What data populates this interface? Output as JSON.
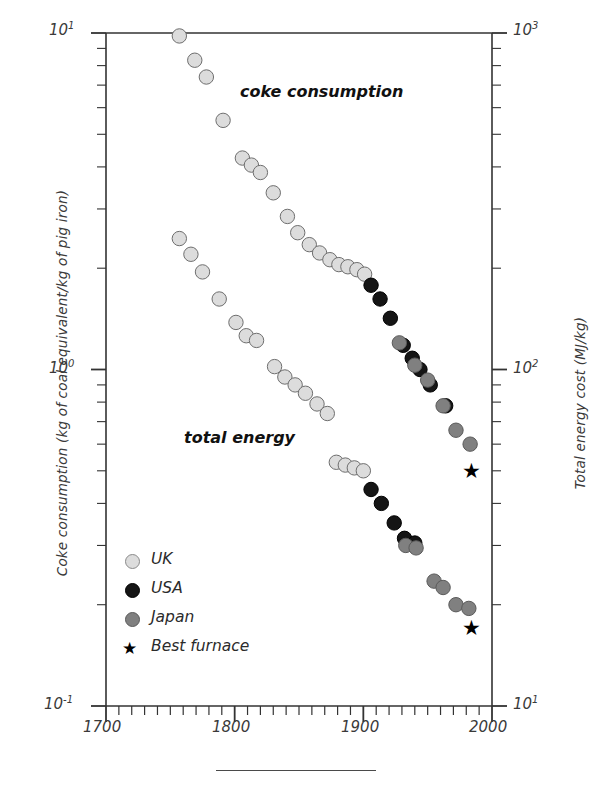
{
  "chart_data": {
    "type": "scatter",
    "title": "",
    "xlabel": "",
    "ylabel": "Coke consumption  (kg of coal equivalent/kg of pig iron)",
    "ylabel_right": "Total energy cost  (MJ/kg)",
    "xlim": [
      1700,
      2000
    ],
    "ylim": [
      0.1,
      10
    ],
    "ylim_right": [
      10,
      1000
    ],
    "yscale": "log",
    "xticks": [
      1700,
      1800,
      1900,
      2000
    ],
    "xticklabels": [
      "1700",
      "1800",
      "1900",
      "2000"
    ],
    "xminor_step": 10,
    "yticks": [
      0.1,
      1,
      10
    ],
    "yticklabels": [
      "10-1",
      "100",
      "101"
    ],
    "yticklabels_right": [
      "101",
      "102",
      "103"
    ],
    "grid": false,
    "legend_position": "lower-left",
    "annotations": [
      {
        "text": "coke consumption",
        "x": 1845,
        "y": 5.1
      },
      {
        "text": "total energy",
        "x": 1812,
        "y": 0.56
      }
    ],
    "series": [
      {
        "name": "UK",
        "color": "#dcdcdc",
        "edge": "#6e6e6e",
        "marker": "circle",
        "points": [
          {
            "x": 1757,
            "y": 9.8
          },
          {
            "x": 1769,
            "y": 8.3
          },
          {
            "x": 1778,
            "y": 7.4
          },
          {
            "x": 1791,
            "y": 5.5
          },
          {
            "x": 1806,
            "y": 4.25
          },
          {
            "x": 1813,
            "y": 4.05
          },
          {
            "x": 1820,
            "y": 3.85
          },
          {
            "x": 1830,
            "y": 3.35
          },
          {
            "x": 1841,
            "y": 2.85
          },
          {
            "x": 1849,
            "y": 2.55
          },
          {
            "x": 1858,
            "y": 2.35
          },
          {
            "x": 1866,
            "y": 2.22
          },
          {
            "x": 1874,
            "y": 2.12
          },
          {
            "x": 1881,
            "y": 2.05
          },
          {
            "x": 1888,
            "y": 2.02
          },
          {
            "x": 1895,
            "y": 1.98
          },
          {
            "x": 1901,
            "y": 1.92
          },
          {
            "x": 1757,
            "y": 2.45
          },
          {
            "x": 1766,
            "y": 2.2
          },
          {
            "x": 1775,
            "y": 1.95
          },
          {
            "x": 1788,
            "y": 1.62
          },
          {
            "x": 1801,
            "y": 1.38
          },
          {
            "x": 1809,
            "y": 1.26
          },
          {
            "x": 1817,
            "y": 1.22
          },
          {
            "x": 1831,
            "y": 1.02
          },
          {
            "x": 1839,
            "y": 0.95
          },
          {
            "x": 1847,
            "y": 0.9
          },
          {
            "x": 1855,
            "y": 0.85
          },
          {
            "x": 1864,
            "y": 0.79
          },
          {
            "x": 1872,
            "y": 0.74
          },
          {
            "x": 1879,
            "y": 0.53
          },
          {
            "x": 1886,
            "y": 0.52
          },
          {
            "x": 1893,
            "y": 0.51
          },
          {
            "x": 1900,
            "y": 0.5
          }
        ]
      },
      {
        "name": "USA",
        "color": "#151515",
        "edge": "#000000",
        "marker": "circle",
        "points": [
          {
            "x": 1906,
            "y": 1.78
          },
          {
            "x": 1913,
            "y": 1.62
          },
          {
            "x": 1921,
            "y": 1.42
          },
          {
            "x": 1931,
            "y": 1.18
          },
          {
            "x": 1938,
            "y": 1.08
          },
          {
            "x": 1944,
            "y": 1.0
          },
          {
            "x": 1952,
            "y": 0.9
          },
          {
            "x": 1964,
            "y": 0.78
          },
          {
            "x": 1906,
            "y": 0.44
          },
          {
            "x": 1914,
            "y": 0.4
          },
          {
            "x": 1924,
            "y": 0.35
          },
          {
            "x": 1932,
            "y": 0.315
          },
          {
            "x": 1940,
            "y": 0.305
          }
        ]
      },
      {
        "name": "Japan",
        "color": "#808080",
        "edge": "#5a5a5a",
        "marker": "circle",
        "points": [
          {
            "x": 1928,
            "y": 1.2
          },
          {
            "x": 1940,
            "y": 1.03
          },
          {
            "x": 1950,
            "y": 0.93
          },
          {
            "x": 1962,
            "y": 0.78
          },
          {
            "x": 1972,
            "y": 0.66
          },
          {
            "x": 1983,
            "y": 0.6
          },
          {
            "x": 1933,
            "y": 0.3
          },
          {
            "x": 1941,
            "y": 0.295
          },
          {
            "x": 1955,
            "y": 0.235
          },
          {
            "x": 1962,
            "y": 0.225
          },
          {
            "x": 1972,
            "y": 0.2
          },
          {
            "x": 1982,
            "y": 0.195
          }
        ]
      },
      {
        "name": "Best furnace",
        "color": "#000000",
        "edge": "#000000",
        "marker": "star",
        "points": [
          {
            "x": 1984,
            "y": 0.5
          },
          {
            "x": 1984,
            "y": 0.17
          }
        ]
      }
    ]
  },
  "axes": {
    "left_title": "Coke consumption  (kg of coal equivalent/kg of pig iron)",
    "right_title": "Total energy cost  (MJ/kg)",
    "x_tick_labels": [
      "1700",
      "1800",
      "1900",
      "2000"
    ],
    "y_left_labels": [
      {
        "mantissa": "10",
        "exp": "1"
      },
      {
        "mantissa": "10",
        "exp": "0"
      },
      {
        "mantissa": "10",
        "exp": "-1"
      }
    ],
    "y_right_labels": [
      {
        "mantissa": "10",
        "exp": "3"
      },
      {
        "mantissa": "10",
        "exp": "2"
      },
      {
        "mantissa": "10",
        "exp": "1"
      }
    ]
  },
  "annotations": {
    "coke": "coke consumption",
    "energy": "total energy"
  },
  "legend": {
    "items": [
      {
        "label": "UK",
        "marker": "circle",
        "color": "#dcdcdc"
      },
      {
        "label": "USA",
        "marker": "circle",
        "color": "#151515"
      },
      {
        "label": "Japan",
        "marker": "circle",
        "color": "#808080"
      },
      {
        "label": "Best furnace",
        "marker": "star",
        "color": "#000000"
      }
    ]
  }
}
